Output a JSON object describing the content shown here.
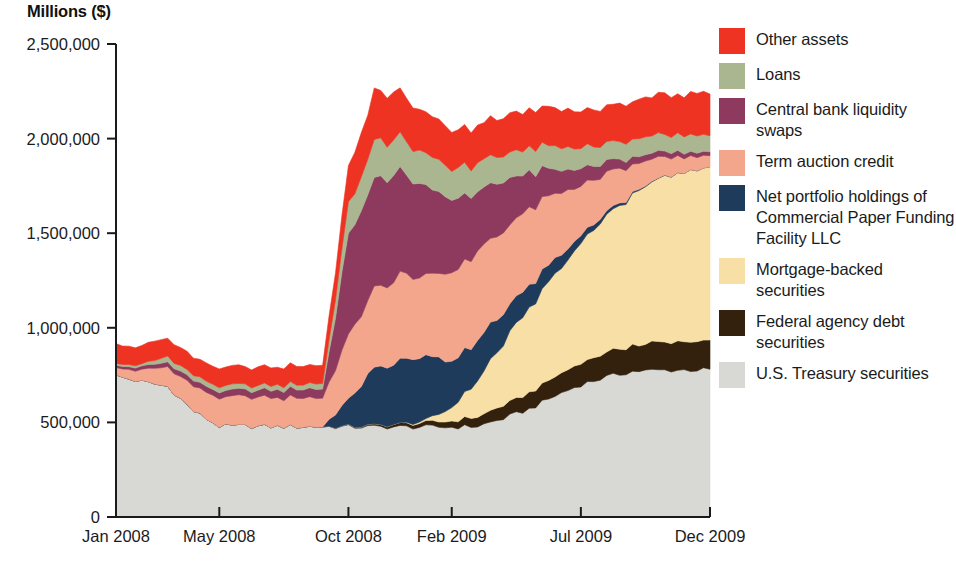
{
  "axis_title": "Millions ($)",
  "legend": {
    "items": [
      {
        "label": "Other assets",
        "color": "#EE3322",
        "key": "other_assets"
      },
      {
        "label": "Loans",
        "color": "#AAB690",
        "key": "loans"
      },
      {
        "label": "Central bank liquidity swaps",
        "color": "#8E3A5F",
        "key": "swaps"
      },
      {
        "label": "Term auction credit",
        "color": "#F4A68C",
        "key": "term_auction"
      },
      {
        "label": "Net portfolio holdings of Commercial Paper Funding Facility LLC",
        "color": "#1E3B5C",
        "key": "cpff"
      },
      {
        "label": "Mortgage-backed securities",
        "color": "#F7DFA6",
        "key": "mbs"
      },
      {
        "label": "Federal agency debt securities",
        "color": "#33210E",
        "key": "agency_debt"
      },
      {
        "label": "U.S. Treasury securities",
        "color": "#D8D9D4",
        "key": "treasury"
      }
    ]
  },
  "chart_data": {
    "type": "area",
    "title": "",
    "xlabel": "",
    "ylabel": "Millions ($)",
    "ylim": [
      0,
      2500000
    ],
    "yticks": [
      0,
      500000,
      1000000,
      1500000,
      2000000,
      2500000
    ],
    "ytick_labels": [
      "0",
      "500,000",
      "1,000,000",
      "1,500,000",
      "2,000,000",
      "2,500,000"
    ],
    "xticks": [
      0,
      4,
      9,
      13,
      18,
      23
    ],
    "xtick_labels": [
      "Jan 2008",
      "May 2008",
      "Oct 2008",
      "Feb 2009",
      "Jul 2009",
      "Dec 2009"
    ],
    "grid": false,
    "legend_position": "right",
    "stacked": true,
    "stack_order_bottom_to_top": [
      "treasury",
      "agency_debt",
      "mbs",
      "cpff",
      "term_auction",
      "swaps",
      "loans",
      "other_assets"
    ],
    "x": [
      "Jan 2008",
      "Feb 2008",
      "Mar 2008",
      "Apr 2008",
      "May 2008",
      "Jun 2008",
      "Jul 2008",
      "Aug 2008",
      "Sep 2008",
      "Oct 2008",
      "Nov 2008",
      "Dec 2008",
      "Jan 2009",
      "Feb 2009",
      "Mar 2009",
      "Apr 2009",
      "May 2009",
      "Jun 2009",
      "Jul 2009",
      "Aug 2009",
      "Sep 2009",
      "Oct 2009",
      "Nov 2009",
      "Dec 2009"
    ],
    "series": [
      {
        "name": "U.S. Treasury securities",
        "key": "treasury",
        "color": "#D8D9D4",
        "values": [
          745000,
          715000,
          690000,
          560000,
          480000,
          480000,
          478000,
          478000,
          478000,
          476000,
          476000,
          476000,
          475000,
          475000,
          480000,
          520000,
          570000,
          640000,
          700000,
          740000,
          770000,
          775000,
          777000,
          778000
        ]
      },
      {
        "name": "Federal agency debt securities",
        "key": "agency_debt",
        "color": "#33210E",
        "values": [
          0,
          0,
          0,
          0,
          0,
          0,
          0,
          0,
          0,
          3000,
          8000,
          15000,
          22000,
          34000,
          50000,
          68000,
          85000,
          100000,
          115000,
          128000,
          138000,
          145000,
          150000,
          152000
        ]
      },
      {
        "name": "Mortgage-backed securities",
        "key": "mbs",
        "color": "#F7DFA6",
        "values": [
          0,
          0,
          0,
          0,
          0,
          0,
          0,
          0,
          0,
          0,
          0,
          0,
          10000,
          70000,
          190000,
          330000,
          440000,
          540000,
          630000,
          720000,
          800000,
          860000,
          900000,
          910000
        ]
      },
      {
        "name": "Net portfolio holdings of Commercial Paper Funding Facility LLC",
        "key": "cpff",
        "color": "#1E3B5C",
        "values": [
          0,
          0,
          0,
          0,
          0,
          0,
          0,
          0,
          0,
          140000,
          300000,
          330000,
          345000,
          250000,
          210000,
          160000,
          120000,
          80000,
          40000,
          20000,
          8000,
          2000,
          0,
          0
        ]
      },
      {
        "name": "Term auction credit",
        "key": "term_auction",
        "color": "#F4A68C",
        "values": [
          40000,
          60000,
          100000,
          130000,
          150000,
          150000,
          150000,
          150000,
          150000,
          330000,
          420000,
          450000,
          420000,
          470000,
          470000,
          440000,
          400000,
          340000,
          270000,
          200000,
          150000,
          110000,
          80000,
          60000
        ]
      },
      {
        "name": "Central bank liquidity swaps",
        "key": "swaps",
        "color": "#8E3A5F",
        "values": [
          12000,
          18000,
          25000,
          30000,
          32000,
          35000,
          40000,
          45000,
          48000,
          520000,
          580000,
          545000,
          470000,
          380000,
          320000,
          260000,
          190000,
          130000,
          90000,
          60000,
          40000,
          30000,
          25000,
          20000
        ]
      },
      {
        "name": "Loans",
        "key": "loans",
        "color": "#AAB690",
        "values": [
          10000,
          12000,
          30000,
          28000,
          26000,
          26000,
          25000,
          26000,
          30000,
          160000,
          200000,
          190000,
          170000,
          160000,
          150000,
          140000,
          130000,
          120000,
          110000,
          100000,
          95000,
          90000,
          88000,
          85000
        ]
      },
      {
        "name": "Other assets",
        "key": "other_assets",
        "color": "#EE3322",
        "values": [
          100000,
          100000,
          98000,
          96000,
          95000,
          94000,
          95000,
          96000,
          98000,
          200000,
          260000,
          240000,
          210000,
          200000,
          200000,
          200000,
          200000,
          200000,
          200000,
          200000,
          205000,
          210000,
          215000,
          220000
        ]
      }
    ]
  }
}
